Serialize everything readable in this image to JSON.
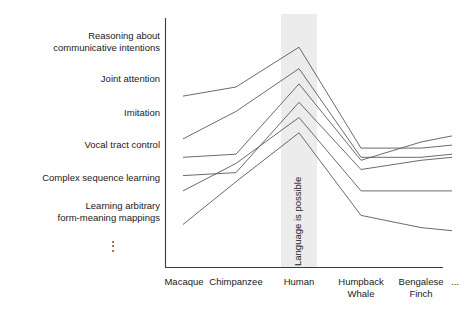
{
  "chart_data": {
    "type": "line",
    "title": "",
    "xlabel": "",
    "ylabel": "",
    "grid": false,
    "legend_position": "left-row-labels",
    "categories": [
      "Macaque",
      "Chimpanzee",
      "Human",
      "Humpback Whale",
      "Bengalese Finch",
      "..."
    ],
    "y_categories": [
      "Reasoning about\ncommunicative intentions",
      "Joint attention",
      "Imitation",
      "Vocal tract control",
      "Complex sequence learning",
      "Learning arbitrary\nform-meaning mappings"
    ],
    "y_continues_glyph": "⋮",
    "annotations": [
      {
        "text": "Language is possible",
        "rotation": -90,
        "region": "Human column highlight band"
      }
    ],
    "series": [
      {
        "name": "Reasoning about communicative intentions",
        "values": [
          5.0,
          5.3,
          6.6,
          3.3,
          3.3,
          3.4
        ]
      },
      {
        "name": "Joint attention",
        "values": [
          3.6,
          4.5,
          5.9,
          3.0,
          3.0,
          3.1
        ]
      },
      {
        "name": "Imitation",
        "values": [
          3.0,
          3.1,
          5.4,
          2.9,
          3.5,
          3.7
        ]
      },
      {
        "name": "Vocal tract control",
        "values": [
          2.4,
          2.5,
          4.8,
          2.6,
          2.9,
          3.0
        ]
      },
      {
        "name": "Complex sequence learning",
        "values": [
          1.9,
          2.8,
          4.3,
          1.9,
          1.9,
          1.9
        ]
      },
      {
        "name": "Learning arbitrary form-meaning mappings",
        "values": [
          0.8,
          2.2,
          3.8,
          1.1,
          0.7,
          0.6
        ]
      }
    ],
    "ylim": [
      0,
      7
    ],
    "highlight_band": {
      "label": "Language is possible",
      "category": "Human",
      "color": "#ececec"
    },
    "line_color": "#5a5a5a",
    "axis_color": "#3a3a3a"
  },
  "axes": {
    "x_axis_name": "species-axis",
    "y_axis_name": "capability-axis"
  }
}
